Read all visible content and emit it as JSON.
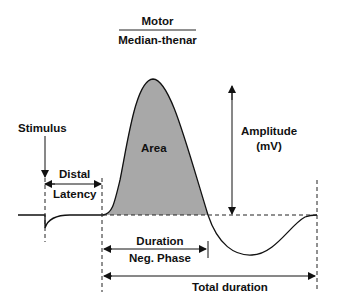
{
  "title": {
    "line1": "Motor",
    "line2": "Median-thenar"
  },
  "labels": {
    "stimulus": "Stimulus",
    "distal": "Distal",
    "latency": "Latency",
    "area": "Area",
    "amplitude": "Amplitude",
    "amplitude_unit": "(mV)",
    "duration": "Duration",
    "neg_phase": "Neg. Phase",
    "total_duration": "Total duration"
  },
  "colors": {
    "area_fill": "#a8a8a8",
    "line": "#111111"
  }
}
